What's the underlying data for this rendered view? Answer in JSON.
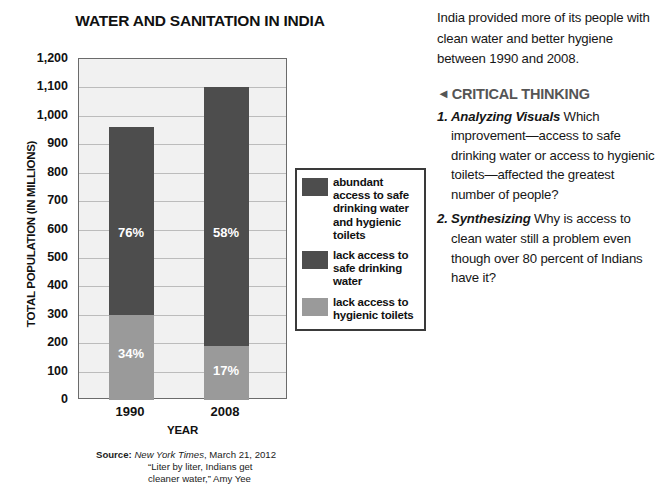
{
  "chart_data": {
    "type": "bar",
    "subtype": "stacked-bar",
    "title": "WATER AND SANITATION IN INDIA",
    "xlabel": "YEAR",
    "ylabel": "TOTAL POPULATION (IN MILLIONS)",
    "ylim": [
      0,
      1200
    ],
    "ytick_labels": [
      "1,200",
      "1,100",
      "1,000",
      "900",
      "800",
      "700",
      "600",
      "500",
      "400",
      "300",
      "200",
      "100",
      "0"
    ],
    "ytick_values": [
      1200,
      1100,
      1000,
      900,
      800,
      700,
      600,
      500,
      400,
      300,
      200,
      100,
      0
    ],
    "grid": true,
    "legend_position": "right",
    "categories": [
      "1990",
      "2008"
    ],
    "series": [
      {
        "name": "lack access to hygienic toilets",
        "color": "#9a9a9a",
        "values": [
          300,
          190
        ],
        "labels": [
          "34%",
          "17%"
        ]
      },
      {
        "name": "abundant access to safe drinking water and hygienic toilets",
        "color": "#4d4d4d",
        "values": [
          660,
          910
        ],
        "labels": [
          "76%",
          "58%"
        ]
      }
    ],
    "bar_totals": [
      960,
      1100
    ],
    "legend": [
      {
        "label": "abundant access to safe drinking water and hygienic toilets",
        "color": "#4d4d4d"
      },
      {
        "label": "lack access to safe drinking water",
        "color": "#4d4d4d"
      },
      {
        "label": "lack access to hygienic toilets",
        "color": "#9a9a9a"
      }
    ]
  },
  "chart": {
    "title": "WATER AND SANITATION IN INDIA",
    "y_axis_title": "TOTAL POPULATION (IN MILLIONS)",
    "x_axis_title": "YEAR",
    "y_ticks": [
      "1,200",
      "1,100",
      "1,000",
      "900",
      "800",
      "700",
      "600",
      "500",
      "400",
      "300",
      "200",
      "100",
      "0"
    ],
    "categories": [
      "1990",
      "2008"
    ],
    "bars": [
      {
        "category": "1990",
        "segments": [
          {
            "name": "dark",
            "label": "76%",
            "from": 300,
            "to": 960,
            "color": "#4d4d4d"
          },
          {
            "name": "light",
            "label": "34%",
            "from": 0,
            "to": 300,
            "color": "#9a9a9a"
          }
        ]
      },
      {
        "category": "2008",
        "segments": [
          {
            "name": "dark",
            "label": "58%",
            "from": 190,
            "to": 1100,
            "color": "#4d4d4d"
          },
          {
            "name": "light",
            "label": "17%",
            "from": 0,
            "to": 190,
            "color": "#9a9a9a"
          }
        ]
      }
    ],
    "legend_items": [
      {
        "label": "abundant access to safe drinking water and hygienic toilets",
        "color": "#4d4d4d"
      },
      {
        "label": "lack access to safe drinking water",
        "color": "#4d4d4d"
      },
      {
        "label": "lack access to hygienic toilets",
        "color": "#9a9a9a"
      }
    ]
  },
  "source": {
    "label": "Source:",
    "publication": "New York Times",
    "date": ", March 21, 2012",
    "line2": "“Liter by liter, Indians get",
    "line3": "cleaner water,” Amy Yee"
  },
  "text_column": {
    "intro": "India provided more of its people with clean water and better hygiene between 1990 and 2008.",
    "critical_thinking_heading": "CRITICAL THINKING",
    "arrow": "◄",
    "questions": [
      {
        "number": "1.",
        "lead": "Analyzing Visuals",
        "body": "  Which improvement—access to safe drinking water or access to hygienic toilets—affected the greatest number of people?"
      },
      {
        "number": "2.",
        "lead": "Synthesizing",
        "body": "  Why is access to clean water still a problem even though over 80 percent of Indians have it?"
      }
    ]
  },
  "colors": {
    "dark_segment": "#4d4d4d",
    "light_segment": "#9a9a9a",
    "plot_background": "#f1f1f1",
    "gridline": "#bcbcbc",
    "heading_gray": "#555555"
  }
}
